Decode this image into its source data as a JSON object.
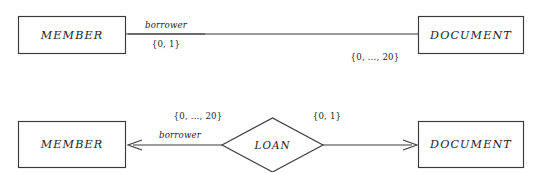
{
  "diagram": {
    "kind": "entity-relationship-diagram",
    "background_color": "#ffffff",
    "line_color": "#3a3a3a",
    "text_color": "#1c1c1c"
  },
  "top_diagram": {
    "name": "attribute-style-notation",
    "left_entity": {
      "label": "MEMBER"
    },
    "right_entity": {
      "label": "DOCUMENT"
    },
    "role_label": "borrower",
    "left_cardinality": "{0, 1}",
    "right_cardinality": "{0, ..., 20}"
  },
  "bottom_diagram": {
    "name": "relationship-diamond-notation",
    "left_entity": {
      "label": "MEMBER"
    },
    "right_entity": {
      "label": "DOCUMENT"
    },
    "relationship": {
      "label": "LOAN"
    },
    "role_label": "borrower",
    "left_cardinality": "{0, ..., 20}",
    "right_cardinality": "{0, 1}"
  }
}
